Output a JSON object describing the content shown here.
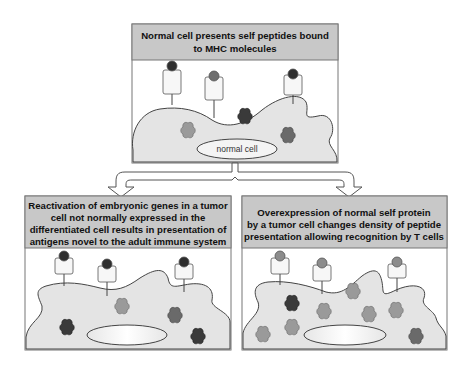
{
  "colors": {
    "header_fill": "#c8c8c8",
    "panel_border": "#777777",
    "cell_fill": "#e4e4e4",
    "cell_stroke": "#444444",
    "receptor_fill": "#f7f7f7",
    "peptide_dark": "#2e2e2e",
    "peptide_medium": "#6e6e6e",
    "peptide_light": "#8c8c8c",
    "protein_dark": "#3a3a3a",
    "protein_medium": "#6a6a6a",
    "protein_light": "#9a9a9a",
    "nucleus_fill": "#f4f4f4"
  },
  "top_panel": {
    "title_line1": "Normal cell presents self peptides bound",
    "title_line2": "to MHC molecules",
    "nucleus_label": "normal cell",
    "mhc_peptides": [
      "dark",
      "medium",
      "dark"
    ],
    "proteins": [
      "light",
      "dark",
      "medium"
    ]
  },
  "left_panel": {
    "title_line1": "Reactivation of embryonic genes in a tumor",
    "title_line2": "cell not normally expressed in the",
    "title_line3": "differentiated cell results in presentation of",
    "title_line4": "antigens novel to the adult immune system",
    "mhc_peptides": [
      "dark",
      "dark",
      "dark"
    ],
    "proteins": [
      "light",
      "medium",
      "dark",
      "dark"
    ]
  },
  "right_panel": {
    "title_line1": "Overexpression of normal self protein",
    "title_line2": "by a tumor cell changes density of peptide",
    "title_line3": "presentation allowing recognition by T cells",
    "mhc_peptides": [
      "light",
      "light",
      "light"
    ],
    "proteins": [
      "dark",
      "light",
      "light",
      "light",
      "light",
      "light",
      "light",
      "medium"
    ]
  }
}
